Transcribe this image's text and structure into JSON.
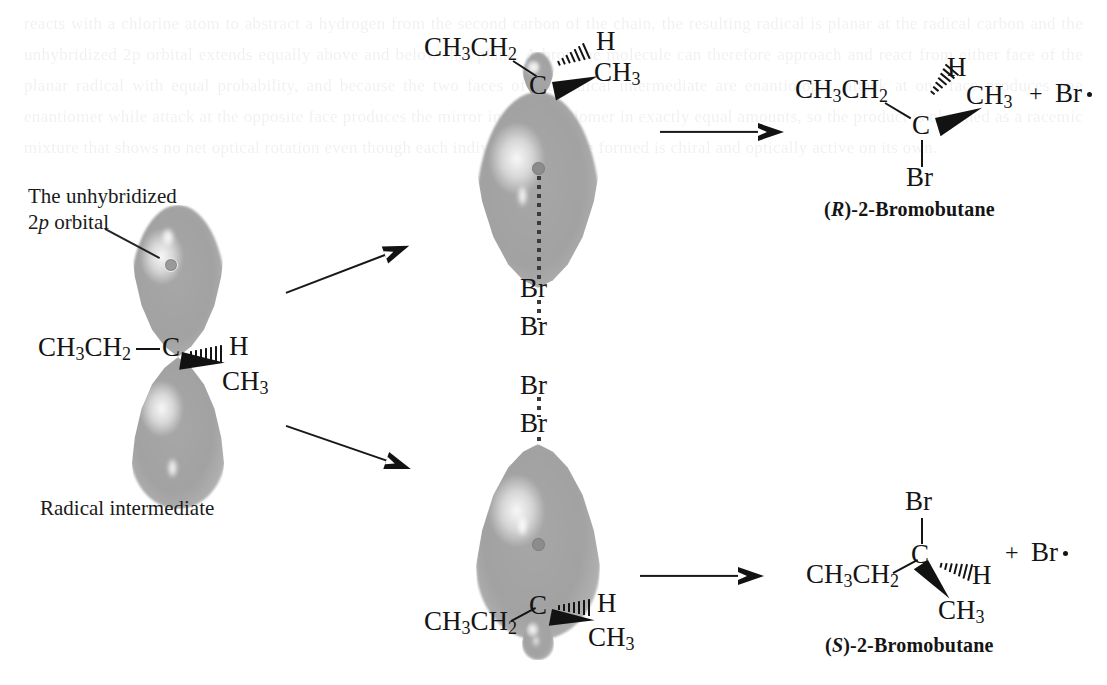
{
  "figure": {
    "type": "reaction-mechanism-diagram"
  },
  "annotations": {
    "orbital_callout_line1": "The unhybridized",
    "orbital_callout_line2_pre": "2",
    "orbital_callout_line2_italic": "p",
    "orbital_callout_line2_post": " orbital",
    "radical_intermediate": "Radical intermediate"
  },
  "atoms": {
    "ethyl": "CH",
    "ethyl_sub1": "3",
    "ethyl_mid": "CH",
    "ethyl_sub2": "2",
    "carbon": "C",
    "hydrogen": "H",
    "methyl": "CH",
    "methyl_sub": "3",
    "bromine": "Br",
    "plus": "+"
  },
  "structures": {
    "radical_intermediate": {
      "left_group": "CH3CH2",
      "center": "C",
      "hash_substituent": "H",
      "wedge_substituent": "CH3",
      "caption": "Radical intermediate"
    },
    "top_approach": {
      "left_group": "CH3CH2",
      "center": "C",
      "hash_substituent": "H",
      "wedge_substituent": "CH3",
      "reagent_atom_1": "Br",
      "reagent_atom_2": "Br"
    },
    "bottom_approach": {
      "left_group": "CH3CH2",
      "center": "C",
      "hash_substituent": "H",
      "wedge_substituent": "CH3",
      "reagent_atom_1": "Br",
      "reagent_atom_2": "Br"
    },
    "product_R": {
      "left_group": "CH3CH2",
      "center": "C",
      "hash_substituent": "H",
      "wedge_substituent": "CH3",
      "down_substituent": "Br",
      "byproduct_plus": "+",
      "byproduct": "Br",
      "name_prefix": "(",
      "name_descriptor": "R",
      "name_suffix": ")-2-Bromobutane"
    },
    "product_S": {
      "left_group": "CH3CH2",
      "center": "C",
      "hash_substituent": "H",
      "wedge_substituent": "CH3",
      "up_substituent": "Br",
      "byproduct_plus": "+",
      "byproduct": "Br",
      "name_prefix": "(",
      "name_descriptor": "S",
      "name_suffix": ")-2-Bromobutane"
    }
  },
  "colors": {
    "ink": "#141414",
    "orbital_gray": "#a2a2a2",
    "orbital_edge": "#cfcfcf",
    "node_dot": "#8c8c8c",
    "paper": "#ffffff"
  },
  "ghost_text": "reacts with a chlorine atom to abstract a hydrogen from the second carbon of the chain, the resulting radical is planar at the radical carbon and the unhybridized 2p orbital extends equally above and below that plane. A bromine molecule can therefore approach and react from either face of the planar radical with equal probability, and because the two faces of the radical intermediate are enantiotopic, attack at one face produces one enantiomer while attack at the opposite face produces the mirror image enantiomer in exactly equal amounts, so the product is obtained as a racemic mixture that shows no net optical rotation even though each individual molecule formed is chiral and optically active on its own."
}
